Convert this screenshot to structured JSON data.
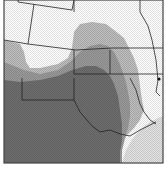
{
  "map": {
    "type": "shaded regional map",
    "colors": {
      "background": "#ffffff",
      "light_zone": "#bdbdbd",
      "medium_zone": "#9a9a9a",
      "dark_zone": "#6e6e6e",
      "gulf_water": "#e2e2e2",
      "border": "#222222",
      "frame": "#444444"
    },
    "zones": [
      {
        "name": "dark-zone"
      },
      {
        "name": "medium-zone"
      },
      {
        "name": "light-zone"
      }
    ],
    "features": [
      {
        "name": "city-dot"
      }
    ]
  }
}
